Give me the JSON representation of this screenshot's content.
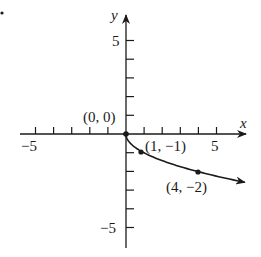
{
  "chart_data": {
    "type": "line",
    "title": "",
    "function": "y = -sqrt(x)",
    "xlabel": "x",
    "ylabel": "y",
    "xlim": [
      -6.5,
      6.5
    ],
    "ylim": [
      -6,
      6.4
    ],
    "x_ticks": [
      -5,
      -4,
      -3,
      -2,
      -1,
      1,
      2,
      3,
      4,
      5
    ],
    "y_ticks": [
      -5,
      -4,
      -3,
      -2,
      -1,
      1,
      2,
      3,
      4,
      5
    ],
    "x_tick_labels": [
      {
        "value": -5,
        "text": "−5"
      },
      {
        "value": 5,
        "text": "5"
      }
    ],
    "y_tick_labels": [
      {
        "value": 5,
        "text": "5"
      },
      {
        "value": -5,
        "text": "−5"
      }
    ],
    "grid": false,
    "series": [
      {
        "name": "y = -√x",
        "x": [
          0,
          0.25,
          1,
          2,
          4,
          6.6
        ],
        "y": [
          0,
          -0.5,
          -1,
          -1.414,
          -2,
          -2.57
        ],
        "end_arrow": true
      }
    ],
    "points": [
      {
        "x": 0,
        "y": 0,
        "label": "(0, 0)"
      },
      {
        "x": 1,
        "y": -1,
        "label": "(1, −1)"
      },
      {
        "x": 4,
        "y": -2,
        "label": "(4, −2)"
      }
    ]
  },
  "labels": {
    "x_axis": "x",
    "y_axis": "y",
    "x_neg5": "−5",
    "x_pos5": "5",
    "y_pos5": "5",
    "y_neg5": "−5",
    "pt_origin": "(0, 0)",
    "pt_1": "(1, −1)",
    "pt_4": "(4, −2)"
  }
}
